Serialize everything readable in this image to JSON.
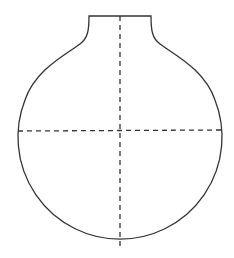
{
  "diagram": {
    "shape": "flask-outline",
    "colors": {
      "stroke": "#333333",
      "background": "#ffffff"
    },
    "neck": {
      "top_y": 16,
      "left_x": 89,
      "right_x": 151
    },
    "bulb": {
      "center_x": 120,
      "center_y": 131,
      "radius": 102
    },
    "axes": [
      {
        "name": "vertical-centerline",
        "style": "dashed"
      },
      {
        "name": "horizontal-centerline",
        "style": "dashed"
      }
    ]
  }
}
